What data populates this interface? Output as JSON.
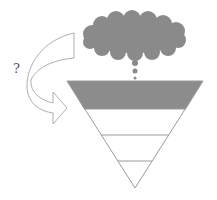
{
  "diagram": {
    "question_mark": "?",
    "colors": {
      "cloud": "#8a8a8a",
      "funnel_top_band": "#8c8c8c",
      "outline": "#9a9a9a",
      "background": "#ffffff"
    },
    "shapes": [
      {
        "type": "thought-cloud",
        "label": ""
      },
      {
        "type": "thought-dots",
        "count": 3
      },
      {
        "type": "inverted-triangle-funnel",
        "layers": 4,
        "shaded_layer": 1
      },
      {
        "type": "curved-arrow",
        "direction": "left-loop-to-right"
      }
    ]
  }
}
